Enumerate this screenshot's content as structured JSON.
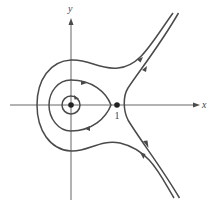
{
  "diagram": {
    "type": "phase-portrait",
    "axes": {
      "x_label": "x",
      "y_label": "y"
    },
    "equilibria": [
      {
        "name": "center",
        "x": 0,
        "y": 0,
        "label": ""
      },
      {
        "name": "saddle",
        "x": 1,
        "y": 0,
        "label": "1"
      }
    ],
    "trajectories": [
      {
        "name": "small-closed-orbit",
        "direction": "clockwise"
      },
      {
        "name": "homoclinic-like-orbit",
        "direction": "clockwise"
      },
      {
        "name": "outer-open-trajectory",
        "direction": "left-to-right upper, right-to-left lower"
      },
      {
        "name": "right-separatrix-trajectory",
        "direction": "outward up and down"
      }
    ],
    "colors": {
      "curve": "#4a4a4a",
      "axis": "#555555",
      "point": "#222222"
    }
  }
}
